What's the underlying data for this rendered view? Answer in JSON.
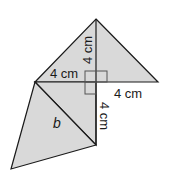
{
  "diagram": {
    "type": "geometric-net",
    "colors": {
      "fill": "#d9d9d9",
      "stroke": "#1a1a1a",
      "background": "#ffffff"
    },
    "labels": {
      "top_vertical": "4 cm",
      "left_horizontal": "4 cm",
      "right_horizontal": "4 cm",
      "bottom_vertical": "4 cm",
      "diagonal": "b"
    }
  }
}
